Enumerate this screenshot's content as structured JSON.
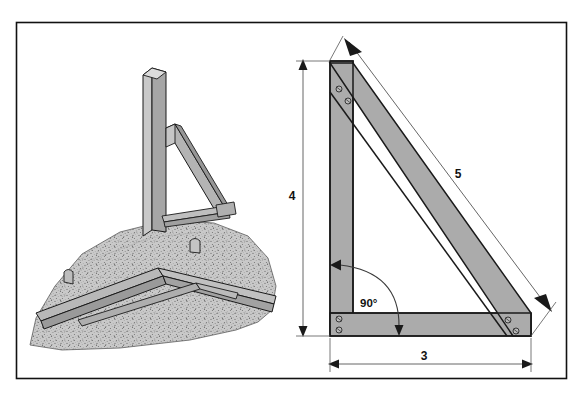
{
  "figure": {
    "frame": {
      "border_color": "#111111",
      "background_color": "#ffffff"
    },
    "colors": {
      "wood_face": "#ababab",
      "wood_face_light": "#c2c2c2",
      "wood_edge": "#8f8f8f",
      "outline": "#1a1a1a",
      "soil_fill": "#c4c4c4",
      "soil_speckle": "#6e6e6e",
      "dimension_line": "#555555",
      "text": "#111111"
    },
    "right_diagram": {
      "name": "triangle-brace-diagram",
      "dimensions": [
        {
          "id": "vertical-leg",
          "label": "4",
          "orientation": "vertical",
          "label_x": 292,
          "label_y": 200
        },
        {
          "id": "hypotenuse",
          "label": "5",
          "orientation": "diagonal",
          "label_x": 458,
          "label_y": 174
        },
        {
          "id": "horizontal-leg",
          "label": "3",
          "orientation": "horizontal",
          "label_x": 424,
          "label_y": 360
        }
      ],
      "angle": {
        "id": "corner-angle",
        "label": "90°",
        "label_x": 360,
        "label_y": 303
      },
      "bolt_groups": [
        {
          "id": "top-corner-bolts",
          "count": 2
        },
        {
          "id": "bottom-left-corner-bolts",
          "count": 2
        },
        {
          "id": "bottom-right-corner-bolts",
          "count": 2
        }
      ]
    },
    "left_illustration": {
      "name": "post-and-brace-perspective-illustration",
      "parts": [
        {
          "id": "vertical-post",
          "label": "vertical post"
        },
        {
          "id": "diagonal-brace",
          "label": "diagonal brace"
        },
        {
          "id": "horizontal-ledger",
          "label": "horizontal ledger"
        },
        {
          "id": "ground-mound",
          "label": "ground"
        },
        {
          "id": "stake-left",
          "label": "stake"
        },
        {
          "id": "stake-right",
          "label": "stake"
        }
      ]
    }
  }
}
